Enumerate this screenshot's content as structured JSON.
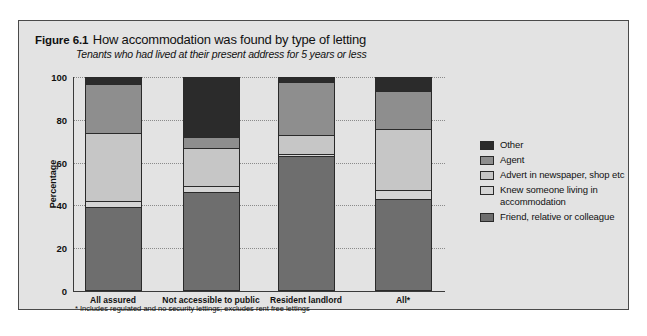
{
  "figure": {
    "number": "Figure 6.1",
    "title": "How accommodation was found by type of letting",
    "subtitle": "Tenants who had lived at their present address for 5 years or less",
    "footnote": "* Includes regulated and no security lettings; excludes rent free lettings"
  },
  "colors": {
    "panel_background": "#e3e3e3",
    "other": "#2b2b2b",
    "agent": "#8e8e8e",
    "advert": "#c6c6c6",
    "knew": "#d5d5d5",
    "friend": "#6e6e6e",
    "axis": "#3a3a3a",
    "grid": "#8a8a8a"
  },
  "chart_data": {
    "type": "bar",
    "stacked": true,
    "title": "How accommodation was found by type of letting",
    "subtitle": "Tenants who had lived at their present address for 5 years or less",
    "xlabel": "",
    "ylabel": "Percentage",
    "ylim": [
      0,
      100
    ],
    "yticks": [
      0,
      20,
      40,
      60,
      80,
      100
    ],
    "grid": true,
    "legend_position": "right",
    "categories": [
      "All assured",
      "Not accessible to public",
      "Resident landlord",
      "All*"
    ],
    "series": [
      {
        "name": "Friend, relative or colleague",
        "color": "#6e6e6e",
        "values": [
          39,
          46,
          63,
          43
        ]
      },
      {
        "name": "Knew someone living in accommodation",
        "color": "#d5d5d5",
        "values": [
          3,
          3,
          1,
          4
        ]
      },
      {
        "name": "Advert in newspaper, shop etc",
        "color": "#c6c6c6",
        "values": [
          32,
          18,
          9,
          29
        ]
      },
      {
        "name": "Agent",
        "color": "#8e8e8e",
        "values": [
          23,
          5,
          25,
          18
        ]
      },
      {
        "name": "Other",
        "color": "#2b2b2b",
        "values": [
          3,
          28,
          2,
          6
        ]
      }
    ]
  },
  "legend": {
    "items": [
      {
        "label": "Other",
        "color": "#2b2b2b"
      },
      {
        "label": "Agent",
        "color": "#8e8e8e"
      },
      {
        "label": "Advert in newspaper, shop etc",
        "color": "#c6c6c6"
      },
      {
        "label": "Knew someone living in accommodation",
        "color": "#d5d5d5"
      },
      {
        "label": "Friend, relative or colleague",
        "color": "#6e6e6e"
      }
    ]
  }
}
